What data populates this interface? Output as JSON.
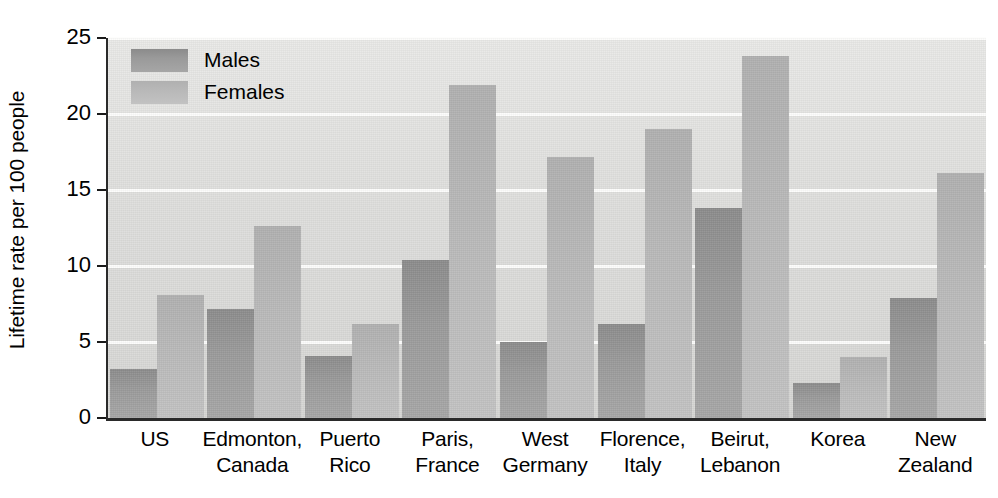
{
  "chart_data": {
    "type": "bar",
    "title": "",
    "xlabel": "",
    "ylabel": "Lifetime rate per 100 people",
    "ylim": [
      0,
      25
    ],
    "yticks": [
      0,
      5,
      10,
      15,
      20,
      25
    ],
    "grid": true,
    "legend_position": "top-left",
    "categories": [
      "US",
      "Edmonton, Canada",
      "Puerto Rico",
      "Paris, France",
      "West Germany",
      "Florence, Italy",
      "Beirut, Lebanon",
      "Korea",
      "New Zealand"
    ],
    "category_lines": [
      [
        "US",
        ""
      ],
      [
        "Edmonton,",
        "Canada"
      ],
      [
        "Puerto",
        "Rico"
      ],
      [
        "Paris,",
        "France"
      ],
      [
        "West",
        "Germany"
      ],
      [
        "Florence,",
        "Italy"
      ],
      [
        "Beirut,",
        "Lebanon"
      ],
      [
        "Korea",
        ""
      ],
      [
        "New",
        "Zealand"
      ]
    ],
    "series": [
      {
        "name": "Males",
        "color": "#9a9a9a",
        "values": [
          3.2,
          7.2,
          4.1,
          10.4,
          5.0,
          6.2,
          13.8,
          2.3,
          7.9
        ]
      },
      {
        "name": "Females",
        "color": "#b9b9b9",
        "values": [
          8.1,
          12.6,
          6.2,
          21.9,
          17.2,
          19.0,
          23.8,
          4.0,
          16.1
        ]
      }
    ]
  },
  "axis": {
    "y_title": "Lifetime rate per 100 people",
    "y_tick_labels": [
      "25",
      "20",
      "15",
      "10",
      "5",
      "0"
    ]
  },
  "legend": {
    "items": [
      {
        "label": "Males"
      },
      {
        "label": "Females"
      }
    ]
  },
  "colors": {
    "male_bar": "#9a9a9a",
    "female_bar": "#b9b9b9",
    "plot_background": "#dededc",
    "gridline": "#fdfdfc",
    "axis": "#2a2a2a",
    "text": "#000000"
  }
}
